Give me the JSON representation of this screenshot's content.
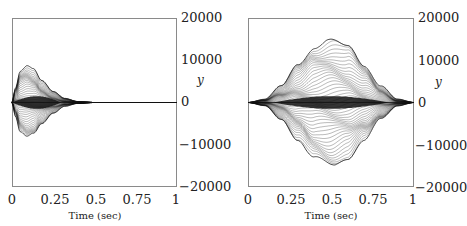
{
  "chart_data": [
    {
      "type": "line",
      "title": "",
      "xlabel": "Time (sec)",
      "ylabel": "y",
      "xlim": [
        0,
        1
      ],
      "ylim": [
        -20000,
        20000
      ],
      "x_ticks": [
        "0",
        "0.25",
        "0.5",
        "0.75",
        "1"
      ],
      "y_ticks": [
        "20000",
        "10000",
        "0",
        "−10000",
        "−20000"
      ],
      "grid": false,
      "legend": null,
      "description": "Dense family of oscillating trajectories; envelope peaks early and decays to zero by ~0.5 s",
      "envelope": {
        "x": [
          0,
          0.02,
          0.05,
          0.09,
          0.13,
          0.18,
          0.25,
          0.32,
          0.4,
          0.5,
          0.75,
          1
        ],
        "upper": [
          0,
          3500,
          7800,
          9000,
          8000,
          5200,
          2600,
          1000,
          250,
          0,
          0,
          0
        ],
        "lower": [
          0,
          -3300,
          -7300,
          -8500,
          -7600,
          -5000,
          -2500,
          -900,
          -220,
          0,
          0,
          0
        ]
      },
      "inner_band": {
        "x_range": [
          0,
          0.3
        ],
        "amplitude": 1500
      }
    },
    {
      "type": "line",
      "title": "",
      "xlabel": "Time (sec)",
      "ylabel": "y",
      "xlim": [
        0,
        1
      ],
      "ylim": [
        -20000,
        20000
      ],
      "x_ticks": [
        "0",
        "0.25",
        "0.5",
        "0.75",
        "1"
      ],
      "y_ticks": [
        "20000",
        "10000",
        "0",
        "−10000",
        "−20000"
      ],
      "grid": false,
      "legend": null,
      "description": "Dense family of oscillating trajectories; symmetric bell-shaped envelope centered at 0.5 s",
      "envelope": {
        "x": [
          0,
          0.1,
          0.2,
          0.3,
          0.4,
          0.5,
          0.6,
          0.7,
          0.8,
          0.9,
          1
        ],
        "upper": [
          0,
          800,
          4000,
          9000,
          13500,
          15000,
          13500,
          9000,
          4000,
          800,
          0
        ],
        "lower": [
          0,
          -800,
          -4000,
          -9000,
          -13500,
          -15000,
          -13500,
          -9000,
          -4000,
          -800,
          0
        ]
      },
      "inner_band": {
        "x_range": [
          0.15,
          0.85
        ],
        "amplitude": 1500
      }
    }
  ],
  "panels": [
    {
      "xlabel": "Time (sec)",
      "ylabel": "y",
      "x_ticks": [
        "0",
        "0.25",
        "0.5",
        "0.75",
        "1"
      ],
      "y_ticks": [
        "20000",
        "10000",
        "0",
        "−10000",
        "−20000"
      ]
    },
    {
      "xlabel": "Time (sec)",
      "ylabel": "y",
      "x_ticks": [
        "0",
        "0.25",
        "0.5",
        "0.75",
        "1"
      ],
      "y_ticks": [
        "20000",
        "10000",
        "0",
        "−10000",
        "−20000"
      ]
    }
  ],
  "colors": {
    "curves": "#111111",
    "frame": "#8a8a8a",
    "background": "#ffffff"
  }
}
